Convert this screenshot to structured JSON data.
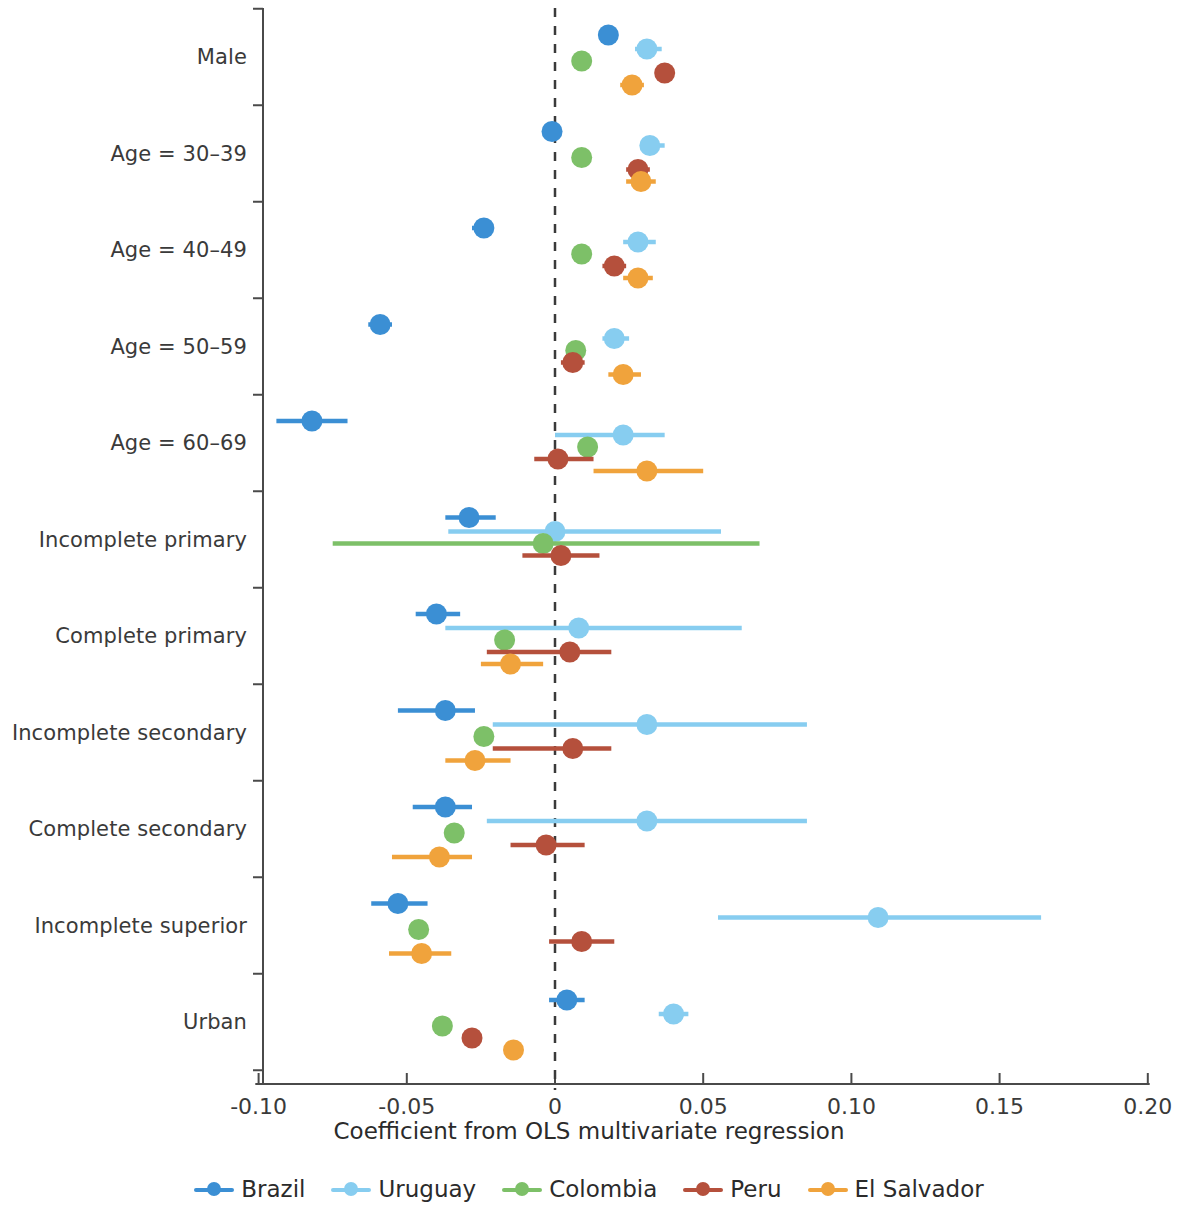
{
  "chart_data": {
    "type": "scatter",
    "title": "",
    "subtitle": "",
    "xlabel": "Coefficient from OLS multivariate regression",
    "ylabel": "",
    "xlim": [
      -0.105,
      0.205
    ],
    "xticks": [
      -0.1,
      -0.05,
      0,
      0.05,
      0.1,
      0.15,
      0.2
    ],
    "xticklabels": [
      "-0.10",
      "-0.05",
      "0",
      "0.05",
      "0.10",
      "0.15",
      "0.20"
    ],
    "grid": false,
    "reference_line": 0,
    "reference_line_style": "dashed",
    "legend_position": "bottom",
    "categories": [
      "Male",
      "Age = 30–39",
      "Age = 40–49",
      "Age = 50–59",
      "Age = 60–69",
      "Incomplete primary",
      "Complete primary",
      "Incomplete secondary",
      "Complete secondary",
      "Incomplete superior",
      "Urban"
    ],
    "series": [
      {
        "name": "Brazil",
        "color": "#3b8fd4",
        "values": [
          0.018,
          -0.001,
          -0.024,
          -0.059,
          -0.082,
          -0.029,
          -0.04,
          -0.037,
          -0.037,
          -0.053,
          0.004
        ],
        "ci_low": [
          0.015,
          -0.004,
          -0.028,
          -0.063,
          -0.094,
          -0.037,
          -0.047,
          -0.053,
          -0.048,
          -0.062,
          -0.002
        ],
        "ci_high": [
          0.021,
          0.002,
          -0.021,
          -0.055,
          -0.07,
          -0.02,
          -0.032,
          -0.027,
          -0.028,
          -0.043,
          0.01
        ]
      },
      {
        "name": "Uruguay",
        "color": "#87cdf0",
        "values": [
          0.031,
          0.032,
          0.028,
          0.02,
          0.023,
          0.0,
          0.008,
          0.031,
          0.031,
          0.109,
          0.04
        ],
        "ci_low": [
          0.027,
          0.029,
          0.023,
          0.016,
          0.0,
          -0.036,
          -0.037,
          -0.021,
          -0.023,
          0.055,
          0.035
        ],
        "ci_high": [
          0.036,
          0.037,
          0.034,
          0.025,
          0.037,
          0.056,
          0.063,
          0.085,
          0.085,
          0.164,
          0.045
        ]
      },
      {
        "name": "Colombia",
        "color": "#7dc068",
        "values": [
          0.009,
          0.009,
          0.009,
          0.007,
          0.011,
          -0.004,
          -0.017,
          -0.024,
          -0.034,
          -0.046,
          -0.038
        ],
        "ci_low": [
          0.007,
          0.007,
          0.007,
          0.005,
          0.009,
          -0.075,
          -0.02,
          -0.027,
          -0.037,
          -0.049,
          -0.04
        ],
        "ci_high": [
          0.011,
          0.011,
          0.011,
          0.009,
          0.013,
          0.069,
          -0.014,
          -0.021,
          -0.031,
          -0.043,
          -0.036
        ]
      },
      {
        "name": "Peru",
        "color": "#b5503c",
        "values": [
          0.037,
          0.028,
          0.02,
          0.006,
          0.001,
          0.002,
          0.005,
          0.006,
          -0.003,
          0.009,
          -0.028
        ],
        "ci_low": [
          0.034,
          0.024,
          0.016,
          0.002,
          -0.007,
          -0.011,
          -0.023,
          -0.021,
          -0.015,
          -0.002,
          -0.031
        ],
        "ci_high": [
          0.04,
          0.032,
          0.024,
          0.01,
          0.013,
          0.015,
          0.019,
          0.019,
          0.01,
          0.02,
          -0.025
        ]
      },
      {
        "name": "El Salvador",
        "color": "#f0a33c",
        "values": [
          0.026,
          0.029,
          0.028,
          0.023,
          0.031,
          null,
          -0.015,
          -0.027,
          -0.039,
          -0.045,
          -0.014
        ],
        "ci_low": [
          0.022,
          0.024,
          0.023,
          0.018,
          0.013,
          null,
          -0.025,
          -0.037,
          -0.055,
          -0.056,
          -0.017
        ],
        "ci_high": [
          0.03,
          0.034,
          0.033,
          0.029,
          0.05,
          null,
          -0.004,
          -0.015,
          -0.028,
          -0.035,
          -0.011
        ]
      }
    ]
  },
  "legend": {
    "items": [
      {
        "label": "Brazil",
        "color": "#3b8fd4"
      },
      {
        "label": "Uruguay",
        "color": "#87cdf0"
      },
      {
        "label": "Colombia",
        "color": "#7dc068"
      },
      {
        "label": "Peru",
        "color": "#b5503c"
      },
      {
        "label": "El Salvador",
        "color": "#f0a33c"
      }
    ]
  },
  "axis": {
    "x_title": "Coefficient from OLS multivariate regression"
  }
}
